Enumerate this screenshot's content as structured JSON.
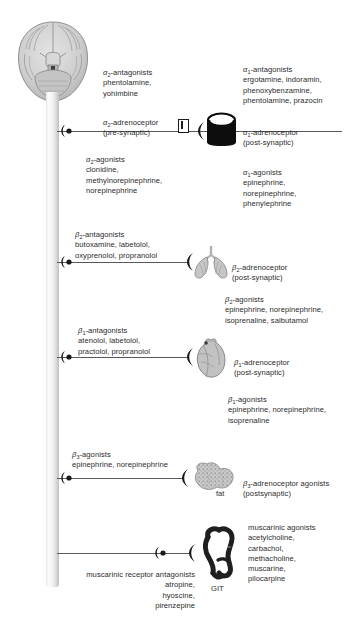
{
  "figure": {
    "background_color": "#ffffff",
    "line_color": "#58595b",
    "text_color": "#2b2b2b"
  },
  "trunk": {
    "name": "nerve-trunk",
    "organ_label": "brain"
  },
  "branches": [
    {
      "id": "alpha2",
      "receptor_name": "α2-adrenoceptor",
      "receptor_name_html": "<span class=\"gr\">α</span><sub>2</sub>-adrenoceptor",
      "synapse": "(pre-synaptic)",
      "antagonists_header": "α2-antagonists",
      "antagonists_header_html": "<span class=\"gr\">α</span><sub>2</sub>-antagonists",
      "antagonists_drugs": "phentolamine,\nyohimbine",
      "agonists_header": "α2-agonists",
      "agonists_header_html": "<span class=\"gr\">α</span><sub>2</sub>-agonists",
      "agonists_drugs": "clonidine,\nmethylnorepinephrine,\nnorepinephrine",
      "organ": "presynaptic-terminal"
    },
    {
      "id": "alpha1",
      "receptor_name": "α1-adrenoceptor",
      "receptor_name_html": "<span class=\"gr\">α</span><sub>1</sub>-adrenoceptor",
      "synapse": "(post-synaptic)",
      "antagonists_header": "α1-antagonists",
      "antagonists_header_html": "<span class=\"gr\">α</span><sub>1</sub>-antagonists",
      "antagonists_drugs": "ergotamine, indoramin,\nphenoxybenzamine,\nphentolamine, prazocin",
      "agonists_header": "α1-agonists",
      "agonists_header_html": "<span class=\"gr\">α</span><sub>1</sub>-agonists",
      "agonists_drugs": "epinephrine,\nnorepinephrine,\nphenylephrine",
      "organ": "smooth-muscle-cylinder"
    },
    {
      "id": "beta2",
      "receptor_name": "β2-adrenoceptor",
      "receptor_name_html": "<span class=\"gr\">β</span><sub>2</sub>-adrenoceptor",
      "synapse": "(post-synaptic)",
      "antagonists_header": "β2-antagonists",
      "antagonists_header_html": "<span class=\"gr\">β</span><sub>2</sub>-antagonists",
      "antagonists_drugs": "butoxamine, labetolol,\noxyprenolol, propranolol",
      "agonists_header": "β2-agonists",
      "agonists_header_html": "<span class=\"gr\">β</span><sub>2</sub>-agonists",
      "agonists_drugs": "epinephrine, norepinephrine,\nisoprenaline, salbutamol",
      "organ": "lungs"
    },
    {
      "id": "beta1",
      "receptor_name": "β1-adrenoceptor",
      "receptor_name_html": "<span class=\"gr\">β</span><sub>1</sub>-adrenoceptor",
      "synapse": "(post-synaptic)",
      "antagonists_header": "β1-antagonists",
      "antagonists_header_html": "<span class=\"gr\">β</span><sub>1</sub>-antagonists",
      "antagonists_drugs": "atenolol, labetolol,\npractolol, propranolol",
      "agonists_header": "β1-agonists",
      "agonists_header_html": "<span class=\"gr\">β</span><sub>1</sub>-agonists",
      "agonists_drugs": "epinephrine, norepinephrine,\nisoprenaline",
      "organ": "heart"
    },
    {
      "id": "beta3",
      "receptor_name": "β3-adrenoceptor agonists",
      "receptor_name_html": "<span class=\"gr\">β</span><sub>3</sub>-adrenoceptor agonists",
      "synapse": "(postsynaptic)",
      "antagonists_header": "",
      "antagonists_drugs": "",
      "agonists_header": "β3-agonists",
      "agonists_header_html": "<span class=\"gr\">β</span><sub>3</sub>-agonists",
      "agonists_drugs": "epinephrine, norepinephrine",
      "organ": "fat",
      "organ_label": "fat"
    },
    {
      "id": "muscarinic",
      "receptor_name": "",
      "synapse": "",
      "antagonists_header": "muscarinic receptor antagonists",
      "antagonists_drugs": "atropine,\nhyoscine,\npirenzepine",
      "agonists_header": "muscarinic agonists",
      "agonists_drugs": "acetylcholine,\ncarbachol,\nmethacholine,\nmuscarine,\npilocarpine",
      "organ": "git",
      "organ_label": "GIT"
    }
  ]
}
